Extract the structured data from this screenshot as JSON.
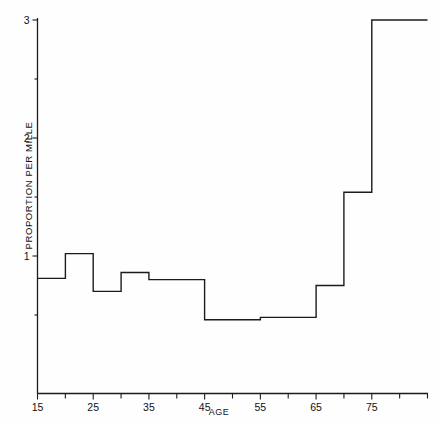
{
  "chart_data": {
    "type": "line",
    "title": "",
    "xlabel": "AGE",
    "ylabel": "PROPORTION PER MILLE",
    "xlim": [
      15,
      85
    ],
    "ylim": [
      0,
      3.1
    ],
    "grid": false,
    "legend": "none",
    "style": "step (histogram-like staircase)",
    "x_tick_labels": [
      "15",
      "25",
      "35",
      "45",
      "55",
      "65",
      "75"
    ],
    "x_tick_values": [
      15,
      25,
      35,
      45,
      55,
      65,
      75
    ],
    "x_minor_tick_values": [
      20,
      30,
      40,
      50,
      60,
      70,
      80,
      85
    ],
    "y_tick_labels": [
      "1",
      "2",
      "3"
    ],
    "y_tick_values": [
      1,
      2,
      3
    ],
    "bins": [
      {
        "x_start": 15,
        "x_end": 20,
        "value": 0.81
      },
      {
        "x_start": 20,
        "x_end": 25,
        "value": 1.02
      },
      {
        "x_start": 25,
        "x_end": 30,
        "value": 0.7
      },
      {
        "x_start": 30,
        "x_end": 35,
        "value": 0.86
      },
      {
        "x_start": 35,
        "x_end": 45,
        "value": 0.8
      },
      {
        "x_start": 45,
        "x_end": 55,
        "value": 0.46
      },
      {
        "x_start": 55,
        "x_end": 65,
        "value": 0.48
      },
      {
        "x_start": 65,
        "x_end": 70,
        "value": 0.75
      },
      {
        "x_start": 70,
        "x_end": 75,
        "value": 1.54
      },
      {
        "x_start": 75,
        "x_end": 85,
        "value": 3.0
      }
    ],
    "colors": {
      "line": "#1b1b1b",
      "axis": "#1b1b1b",
      "background": "#fefefe"
    }
  }
}
